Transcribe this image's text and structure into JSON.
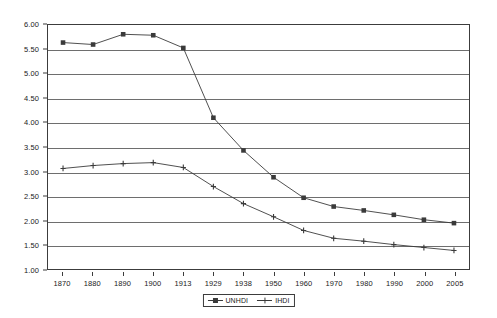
{
  "chart_data": {
    "type": "line",
    "title": "",
    "subtitle": "",
    "xlabel": "",
    "ylabel": "",
    "categories": [
      "1870",
      "1880",
      "1890",
      "1900",
      "1913",
      "1929",
      "1938",
      "1950",
      "1960",
      "1970",
      "1980",
      "1990",
      "2000",
      "2005"
    ],
    "series": [
      {
        "name": "UNHDI",
        "marker": "square",
        "color": "#3a3a3a",
        "values": [
          5.64,
          5.6,
          5.81,
          5.79,
          5.53,
          4.1,
          3.43,
          2.88,
          2.46,
          2.28,
          2.2,
          2.11,
          2.01,
          1.94
        ]
      },
      {
        "name": "IHDI",
        "marker": "cross",
        "color": "#3a3a3a",
        "values": [
          3.06,
          3.12,
          3.16,
          3.18,
          3.08,
          2.69,
          2.34,
          2.07,
          1.79,
          1.63,
          1.57,
          1.5,
          1.44,
          1.38
        ]
      }
    ],
    "ylim": [
      1.0,
      6.0
    ],
    "ytick_step": 0.5,
    "yticks": [
      "1.00",
      "1.50",
      "2.00",
      "2.50",
      "3.00",
      "3.50",
      "4.00",
      "4.50",
      "5.00",
      "5.50",
      "6.00"
    ],
    "grid": {
      "horizontal": true,
      "vertical": false,
      "color": "#6e6e6e"
    },
    "legend": {
      "position": "bottom-center",
      "entries": [
        "UNHDI",
        "IHDI"
      ]
    },
    "plot_background": "#ffffff",
    "border_color": "#3c3c3c"
  }
}
